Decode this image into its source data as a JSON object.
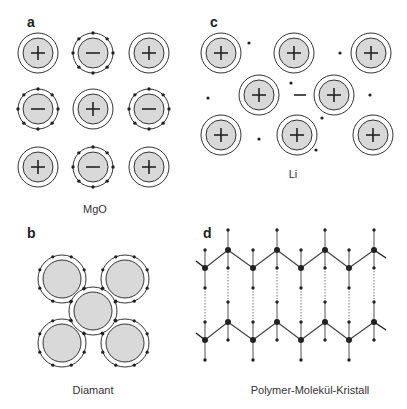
{
  "panels": {
    "a": {
      "label": "a",
      "caption": "MgO"
    },
    "b": {
      "label": "b",
      "caption": "Diamant"
    },
    "c": {
      "label": "c",
      "caption": "Li"
    },
    "d": {
      "label": "d",
      "caption": "Polymer-Molekül-Kristall"
    }
  },
  "colors": {
    "core_fill": "#d9d9d9",
    "stroke": "#333333",
    "electron": "#222222"
  },
  "mgo_grid": [
    [
      "+",
      "-",
      "+"
    ],
    [
      "-",
      "+",
      "-"
    ],
    [
      "+",
      "-",
      "+"
    ]
  ],
  "li_free_electron_sign": "−"
}
